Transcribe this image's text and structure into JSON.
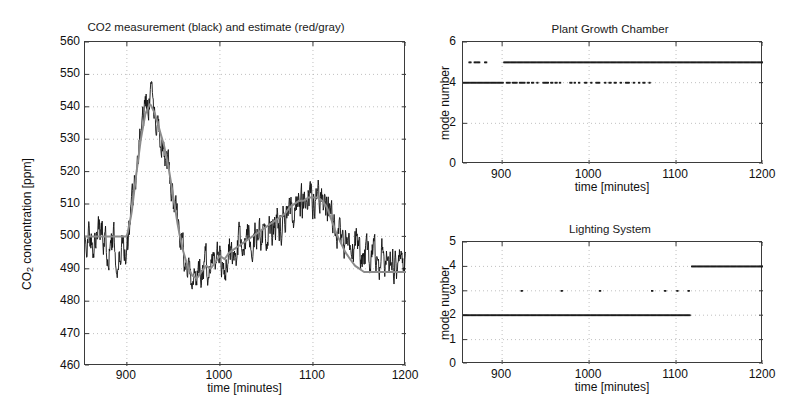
{
  "figure": {
    "width": 812,
    "height": 419,
    "background": "#ffffff",
    "axis_color": "#3b3b3b",
    "grid_color": "#b0b0b0"
  },
  "main_plot": {
    "title": "CO2 measurement (black) and estimate (red/gray)",
    "xlabel": "time [minutes]",
    "ylabel_prefix": "CO",
    "ylabel_sub": "2",
    "ylabel_suffix": " concentration [ppm]",
    "ylabel_full": "CO2 concentration [ppm]",
    "ytick_labels": [
      "560",
      "550",
      "540",
      "530",
      "520",
      "510",
      "500",
      "490",
      "480",
      "470",
      "460"
    ],
    "xtick_labels": [
      "900",
      "1000",
      "1100",
      "1200"
    ],
    "measurement_color": "#111111",
    "estimate_color": "#8c8c8c"
  },
  "top_right_plot": {
    "title": "Plant Growth Chamber",
    "xlabel": "time [minutes]",
    "ylabel": "mode number",
    "ytick_labels": [
      "6",
      "4",
      "2",
      "0"
    ],
    "xtick_labels": [
      "900",
      "1000",
      "1100",
      "1200"
    ],
    "marker_color": "#1c1c1c"
  },
  "bottom_right_plot": {
    "title": "Lighting System",
    "xlabel": "time [minutes]",
    "ylabel": "mode number",
    "ytick_labels": [
      "5",
      "4",
      "3",
      "2",
      "1",
      "0"
    ],
    "xtick_labels": [
      "900",
      "1000",
      "1100",
      "1200"
    ],
    "marker_color": "#1c1c1c"
  },
  "chart_data": [
    {
      "type": "line",
      "id": "co2-timeseries",
      "title": "CO2 measurement (black) and estimate (red/gray)",
      "xlabel": "time [minutes]",
      "ylabel": "CO2 concentration [ppm]",
      "xlim": [
        855,
        1200
      ],
      "ylim": [
        460,
        560
      ],
      "xticks": [
        900,
        1000,
        1100,
        1200
      ],
      "yticks": [
        460,
        470,
        480,
        490,
        500,
        510,
        520,
        530,
        540,
        550,
        560
      ],
      "grid": true,
      "legend": "in-title",
      "series": [
        {
          "name": "measurement (black)",
          "color": "#111111",
          "noise_amplitude": 4.5,
          "x": [
            855,
            860,
            865,
            870,
            875,
            880,
            885,
            890,
            895,
            900,
            905,
            910,
            915,
            920,
            925,
            930,
            935,
            940,
            945,
            950,
            955,
            960,
            965,
            970,
            975,
            980,
            985,
            990,
            995,
            1000,
            1005,
            1010,
            1015,
            1020,
            1025,
            1030,
            1035,
            1040,
            1045,
            1050,
            1055,
            1060,
            1065,
            1070,
            1075,
            1080,
            1085,
            1090,
            1095,
            1100,
            1105,
            1110,
            1115,
            1120,
            1125,
            1130,
            1135,
            1140,
            1145,
            1150,
            1155,
            1160,
            1165,
            1170,
            1175,
            1180,
            1185,
            1190,
            1195,
            1200
          ],
          "y": [
            500,
            502,
            498,
            504,
            500,
            496,
            499,
            494,
            497,
            496,
            508,
            520,
            532,
            539,
            543,
            537,
            530,
            527,
            521,
            512,
            503,
            496,
            490,
            487,
            486,
            489,
            492,
            488,
            491,
            494,
            492,
            496,
            495,
            498,
            497,
            500,
            499,
            502,
            501,
            503,
            502,
            505,
            504,
            506,
            508,
            507,
            511,
            509,
            512,
            510,
            513,
            511,
            509,
            506,
            503,
            500,
            498,
            496,
            497,
            494,
            496,
            493,
            495,
            492,
            494,
            491,
            493,
            490,
            492,
            491
          ]
        },
        {
          "name": "estimate (red/gray)",
          "color": "#8c8c8c",
          "x": [
            855,
            860,
            865,
            870,
            875,
            880,
            885,
            890,
            895,
            900,
            905,
            910,
            915,
            920,
            925,
            930,
            935,
            940,
            945,
            950,
            955,
            960,
            965,
            970,
            975,
            980,
            985,
            990,
            995,
            1000,
            1005,
            1010,
            1015,
            1020,
            1025,
            1030,
            1035,
            1040,
            1045,
            1050,
            1055,
            1060,
            1065,
            1070,
            1075,
            1080,
            1085,
            1090,
            1095,
            1100,
            1105,
            1110,
            1115,
            1120,
            1125,
            1130,
            1135,
            1140,
            1145,
            1150,
            1155,
            1160,
            1165,
            1170,
            1175,
            1180,
            1185,
            1190,
            1195,
            1200
          ],
          "y": [
            500,
            500,
            500,
            500,
            500,
            500,
            500,
            500,
            500,
            500,
            507,
            519,
            530,
            538,
            541,
            538,
            533,
            528,
            521,
            512,
            503,
            496,
            491,
            488,
            487,
            489,
            491,
            490,
            492,
            494,
            493,
            495,
            496,
            497,
            498,
            499,
            500,
            501,
            502,
            503,
            504,
            505,
            506,
            507,
            509,
            510,
            511,
            511,
            512,
            512,
            512,
            511,
            509,
            505,
            501,
            498,
            495,
            493,
            491,
            490,
            489,
            489,
            489,
            489,
            489,
            489,
            489,
            489,
            489,
            489
          ]
        }
      ]
    },
    {
      "type": "scatter",
      "id": "plant-growth-chamber-modes",
      "title": "Plant Growth Chamber",
      "xlabel": "time [minutes]",
      "ylabel": "mode number",
      "xlim": [
        855,
        1200
      ],
      "ylim": [
        0,
        6
      ],
      "xticks": [
        900,
        1000,
        1100,
        1200
      ],
      "yticks": [
        0,
        2,
        4,
        6
      ],
      "grid": true,
      "series": [
        {
          "name": "mode 5",
          "value": 5,
          "color": "#1c1c1c",
          "segments": [
            [
              862,
              864
            ],
            [
              868,
              874
            ],
            [
              880,
              882
            ],
            [
              902,
              1200
            ]
          ]
        },
        {
          "name": "mode 4",
          "value": 4,
          "color": "#1c1c1c",
          "segments": [
            [
              855,
              901
            ],
            [
              905,
              909
            ],
            [
              912,
              917
            ],
            [
              920,
              926
            ],
            [
              929,
              931
            ],
            [
              934,
              936
            ],
            [
              940,
              941
            ],
            [
              947,
              953
            ],
            [
              956,
              958
            ],
            [
              961,
              963
            ],
            [
              966,
              967
            ],
            [
              978,
              980
            ],
            [
              983,
              984
            ],
            [
              988,
              989
            ],
            [
              995,
              997
            ],
            [
              1002,
              1003
            ],
            [
              1008,
              1012
            ],
            [
              1018,
              1019
            ],
            [
              1023,
              1025
            ],
            [
              1029,
              1031
            ],
            [
              1036,
              1037
            ],
            [
              1042,
              1046
            ],
            [
              1051,
              1052
            ],
            [
              1057,
              1058
            ],
            [
              1062,
              1064
            ],
            [
              1069,
              1070
            ]
          ]
        }
      ]
    },
    {
      "type": "scatter",
      "id": "lighting-system-modes",
      "title": "Lighting System",
      "xlabel": "time [minutes]",
      "ylabel": "mode number",
      "xlim": [
        855,
        1200
      ],
      "ylim": [
        0,
        5
      ],
      "xticks": [
        900,
        1000,
        1100,
        1200
      ],
      "yticks": [
        0,
        1,
        2,
        3,
        4,
        5
      ],
      "grid": true,
      "series": [
        {
          "name": "mode 2",
          "value": 2,
          "color": "#1c1c1c",
          "segments": [
            [
              855,
              1116
            ]
          ]
        },
        {
          "name": "mode 3",
          "value": 3,
          "color": "#1c1c1c",
          "segments": [
            [
              922,
              923
            ],
            [
              968,
              969
            ],
            [
              1012,
              1013
            ],
            [
              1072,
              1073
            ],
            [
              1087,
              1088
            ],
            [
              1101,
              1102
            ],
            [
              1114,
              1115
            ]
          ]
        },
        {
          "name": "mode 4",
          "value": 4,
          "color": "#1c1c1c",
          "segments": [
            [
              1118,
              1200
            ]
          ]
        }
      ]
    }
  ]
}
